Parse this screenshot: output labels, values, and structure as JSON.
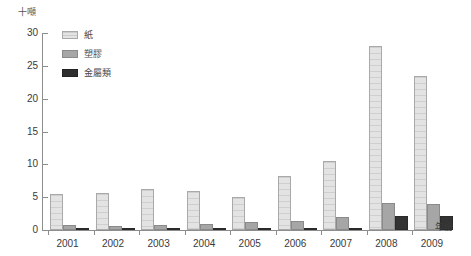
{
  "chart": {
    "title": "",
    "y_unit_label": "十噸",
    "x_axis_title": "年份"
  },
  "legend": {
    "items": [
      {
        "label": "紙",
        "key": "paper",
        "color": "#e3e3e3"
      },
      {
        "label": "塑膠",
        "key": "plastic",
        "color": "#a6a6a6"
      },
      {
        "label": "金屬類",
        "key": "metal",
        "color": "#2e2e2e"
      }
    ]
  },
  "axis": {
    "y_ticks": [
      "0",
      "5",
      "10",
      "15",
      "20",
      "25",
      "30"
    ],
    "x_ticks": [
      "2001",
      "2002",
      "2003",
      "2004",
      "2005",
      "2006",
      "2007",
      "2008",
      "2009"
    ]
  },
  "chart_data": {
    "type": "bar",
    "title": "",
    "xlabel": "年份",
    "ylabel": "十噸",
    "ylim": [
      0,
      30
    ],
    "yticks": [
      0,
      5,
      10,
      15,
      20,
      25,
      30
    ],
    "grid": false,
    "legend_position": "top-left",
    "categories": [
      "2001",
      "2002",
      "2003",
      "2004",
      "2005",
      "2006",
      "2007",
      "2008",
      "2009"
    ],
    "series": [
      {
        "name": "紙",
        "color": "#e3e3e3",
        "values": [
          5.5,
          5.7,
          6.3,
          5.9,
          5.0,
          8.3,
          10.5,
          28.0,
          23.5
        ]
      },
      {
        "name": "塑膠",
        "color": "#a6a6a6",
        "values": [
          0.7,
          0.6,
          0.8,
          0.9,
          1.2,
          1.4,
          2.0,
          4.1,
          3.9
        ]
      },
      {
        "name": "金屬類",
        "color": "#2e2e2e",
        "values": [
          0.2,
          0.2,
          0.2,
          0.2,
          0.2,
          0.2,
          0.3,
          2.2,
          2.2
        ]
      }
    ]
  }
}
